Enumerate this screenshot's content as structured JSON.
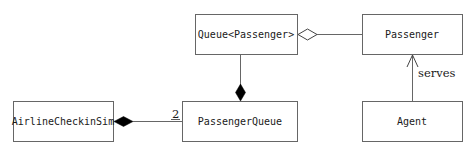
{
  "diagram": {
    "type": "uml-class-diagram",
    "classes": [
      {
        "id": "queue",
        "name": "Queue<Passenger>"
      },
      {
        "id": "passenger",
        "name": "Passenger"
      },
      {
        "id": "sim",
        "name": "AirlineCheckinSim"
      },
      {
        "id": "pqueue",
        "name": "PassengerQueue"
      },
      {
        "id": "agent",
        "name": "Agent"
      }
    ],
    "relations": [
      {
        "from": "queue",
        "to": "passenger",
        "kind": "aggregation",
        "label": ""
      },
      {
        "from": "pqueue",
        "to": "queue",
        "kind": "composition",
        "label": ""
      },
      {
        "from": "sim",
        "to": "pqueue",
        "kind": "composition",
        "multiplicity": "2"
      },
      {
        "from": "agent",
        "to": "passenger",
        "kind": "association-navigable",
        "label": "serves"
      }
    ],
    "colors": {
      "line": "#555555",
      "text": "#1a1a1a",
      "fill": "#ffffff"
    }
  }
}
